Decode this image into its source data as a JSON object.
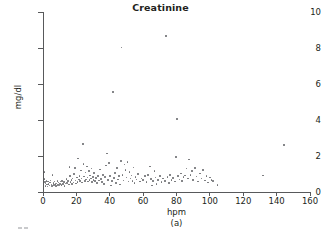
{
  "chart_data": {
    "type": "scatter",
    "title": "Creatinine",
    "xlabel": "hpm",
    "ylabel": "mg/dl",
    "caption": "(a)",
    "xlim": [
      0,
      160
    ],
    "ylim": [
      0,
      10
    ],
    "xticks": [
      0,
      20,
      40,
      60,
      80,
      100,
      120,
      140,
      160
    ],
    "yticks": [
      0,
      2,
      4,
      6,
      8,
      10
    ],
    "grid": false,
    "legend": null,
    "marker_color": "#6d6e71",
    "axis_color": "#58595b",
    "points": [
      [
        0.8,
        1.12
      ],
      [
        1.0,
        0.72
      ],
      [
        1.2,
        0.55
      ],
      [
        1.4,
        0.33
      ],
      [
        1.6,
        0.48
      ],
      [
        2.0,
        0.62
      ],
      [
        2.3,
        0.42
      ],
      [
        2.6,
        0.3
      ],
      [
        3.0,
        0.58
      ],
      [
        3.4,
        0.45
      ],
      [
        3.8,
        0.36
      ],
      [
        4.2,
        0.52
      ],
      [
        4.6,
        0.65
      ],
      [
        5.0,
        0.41
      ],
      [
        5.4,
        0.34
      ],
      [
        5.8,
        0.95
      ],
      [
        6.2,
        0.5
      ],
      [
        6.6,
        0.38
      ],
      [
        7.0,
        0.58
      ],
      [
        7.4,
        0.44
      ],
      [
        7.8,
        0.33
      ],
      [
        8.2,
        0.48
      ],
      [
        8.6,
        0.6
      ],
      [
        9.0,
        0.4
      ],
      [
        9.4,
        0.52
      ],
      [
        9.8,
        0.35
      ],
      [
        10.2,
        0.46
      ],
      [
        10.6,
        0.58
      ],
      [
        11.0,
        0.38
      ],
      [
        11.5,
        0.62
      ],
      [
        12.0,
        0.44
      ],
      [
        12.5,
        0.55
      ],
      [
        13.0,
        0.33
      ],
      [
        13.5,
        0.47
      ],
      [
        14.0,
        0.71
      ],
      [
        14.5,
        0.5
      ],
      [
        15.0,
        0.6
      ],
      [
        15.5,
        0.42
      ],
      [
        16.0,
        1.38
      ],
      [
        16.2,
        0.88
      ],
      [
        16.6,
        0.56
      ],
      [
        17.0,
        0.66
      ],
      [
        17.4,
        0.45
      ],
      [
        17.8,
        0.74
      ],
      [
        18.2,
        0.52
      ],
      [
        18.6,
        1.0
      ],
      [
        19.0,
        1.32
      ],
      [
        19.4,
        0.63
      ],
      [
        19.8,
        0.48
      ],
      [
        20.2,
        0.8
      ],
      [
        20.6,
        0.57
      ],
      [
        21.0,
        1.85
      ],
      [
        21.4,
        0.7
      ],
      [
        21.8,
        0.9
      ],
      [
        22.2,
        0.6
      ],
      [
        22.6,
        1.2
      ],
      [
        23.0,
        0.75
      ],
      [
        23.4,
        0.52
      ],
      [
        23.8,
        2.66
      ],
      [
        24.2,
        1.56
      ],
      [
        24.6,
        0.85
      ],
      [
        25.0,
        0.62
      ],
      [
        25.4,
        1.08
      ],
      [
        25.8,
        0.7
      ],
      [
        26.2,
        1.42
      ],
      [
        26.6,
        0.8
      ],
      [
        27.0,
        0.58
      ],
      [
        27.4,
        1.16
      ],
      [
        27.8,
        0.66
      ],
      [
        28.2,
        0.92
      ],
      [
        28.6,
        0.74
      ],
      [
        29.0,
        1.3
      ],
      [
        29.4,
        0.54
      ],
      [
        29.8,
        0.84
      ],
      [
        30.2,
        0.68
      ],
      [
        30.6,
        1.05
      ],
      [
        31.0,
        0.6
      ],
      [
        31.6,
        0.78
      ],
      [
        32.2,
        0.5
      ],
      [
        32.8,
        0.88
      ],
      [
        33.4,
        0.64
      ],
      [
        34.0,
        1.24
      ],
      [
        34.6,
        0.72
      ],
      [
        35.2,
        0.56
      ],
      [
        35.8,
        0.95
      ],
      [
        36.4,
        0.45
      ],
      [
        37.0,
        0.82
      ],
      [
        37.6,
        1.48
      ],
      [
        38.2,
        2.14
      ],
      [
        38.8,
        0.66
      ],
      [
        39.4,
        1.6
      ],
      [
        40.0,
        0.9
      ],
      [
        40.6,
        0.36
      ],
      [
        41.2,
        0.6
      ],
      [
        41.8,
        5.55
      ],
      [
        42.4,
        0.78
      ],
      [
        43.0,
        1.05
      ],
      [
        43.6,
        0.5
      ],
      [
        44.2,
        1.32
      ],
      [
        44.8,
        0.7
      ],
      [
        45.4,
        0.88
      ],
      [
        46.0,
        0.42
      ],
      [
        46.6,
        1.72
      ],
      [
        47.0,
        8.02
      ],
      [
        47.6,
        0.95
      ],
      [
        48.2,
        0.64
      ],
      [
        48.8,
        1.52
      ],
      [
        49.4,
        1.22
      ],
      [
        50.0,
        0.8
      ],
      [
        50.6,
        1.66
      ],
      [
        51.2,
        0.58
      ],
      [
        51.8,
        1.12
      ],
      [
        52.4,
        0.74
      ],
      [
        53.0,
        0.92
      ],
      [
        53.6,
        0.62
      ],
      [
        54.2,
        1.36
      ],
      [
        54.8,
        0.5
      ],
      [
        55.4,
        0.84
      ],
      [
        56.0,
        0.7
      ],
      [
        57.0,
        1.0
      ],
      [
        58.0,
        0.58
      ],
      [
        59.0,
        0.76
      ],
      [
        60.0,
        0.66
      ],
      [
        61.0,
        0.88
      ],
      [
        62.0,
        0.54
      ],
      [
        63.0,
        0.94
      ],
      [
        64.0,
        1.42
      ],
      [
        64.6,
        0.72
      ],
      [
        65.2,
        0.36
      ],
      [
        66.0,
        0.62
      ],
      [
        66.8,
        1.18
      ],
      [
        67.4,
        0.8
      ],
      [
        68.0,
        0.46
      ],
      [
        69.0,
        0.68
      ],
      [
        70.0,
        0.88
      ],
      [
        71.0,
        0.55
      ],
      [
        72.0,
        0.74
      ],
      [
        73.0,
        0.62
      ],
      [
        73.8,
        8.68
      ],
      [
        74.6,
        0.84
      ],
      [
        75.4,
        0.5
      ],
      [
        76.2,
        0.96
      ],
      [
        77.0,
        0.66
      ],
      [
        78.0,
        0.78
      ],
      [
        79.0,
        0.58
      ],
      [
        79.6,
        1.94
      ],
      [
        80.4,
        4.04
      ],
      [
        81.0,
        0.88
      ],
      [
        81.8,
        0.7
      ],
      [
        82.6,
        1.02
      ],
      [
        83.4,
        0.6
      ],
      [
        84.2,
        0.82
      ],
      [
        85.0,
        0.92
      ],
      [
        86.0,
        1.3
      ],
      [
        86.8,
        0.74
      ],
      [
        87.6,
        1.8
      ],
      [
        88.4,
        0.96
      ],
      [
        89.2,
        1.16
      ],
      [
        90.0,
        0.66
      ],
      [
        91.0,
        1.34
      ],
      [
        92.0,
        0.86
      ],
      [
        93.0,
        0.58
      ],
      [
        94.0,
        1.02
      ],
      [
        95.0,
        0.74
      ],
      [
        96.0,
        1.22
      ],
      [
        97.0,
        0.64
      ],
      [
        98.0,
        0.9
      ],
      [
        99.0,
        0.52
      ],
      [
        100.0,
        0.8
      ],
      [
        101.0,
        0.68
      ],
      [
        102.0,
        0.6
      ],
      [
        104.5,
        0.38
      ],
      [
        132.0,
        0.92
      ],
      [
        144.5,
        2.6
      ]
    ]
  }
}
